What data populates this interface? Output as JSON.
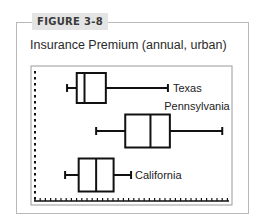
{
  "figure": {
    "tab_label": "FIGURE 3-8",
    "title": "Insurance Premium (annual, urban)"
  },
  "colors": {
    "frame_border": "#b9b9b9",
    "tab_background": "#e4e4e4",
    "ink": "#111111"
  },
  "chart_data": {
    "type": "boxplot",
    "title": "Insurance Premium (annual, urban)",
    "xlabel": "",
    "ylabel": "",
    "orientation": "horizontal",
    "x_axis_ticks": "unlabeled dotted tick marks",
    "y_axis_ticks": "unlabeled dotted tick marks",
    "xlim": [
      0,
      100
    ],
    "grid": false,
    "legend": "none (series labeled inline)",
    "series": [
      {
        "name": "Texas",
        "min": 16,
        "q1": 21,
        "median": 25,
        "q3": 36,
        "max": 68
      },
      {
        "name": "Pennsylvania",
        "min": 31,
        "q1": 46,
        "median": 59,
        "q3": 69,
        "max": 96
      },
      {
        "name": "California",
        "min": 15,
        "q1": 22,
        "median": 31,
        "q3": 40,
        "max": 49
      }
    ]
  }
}
